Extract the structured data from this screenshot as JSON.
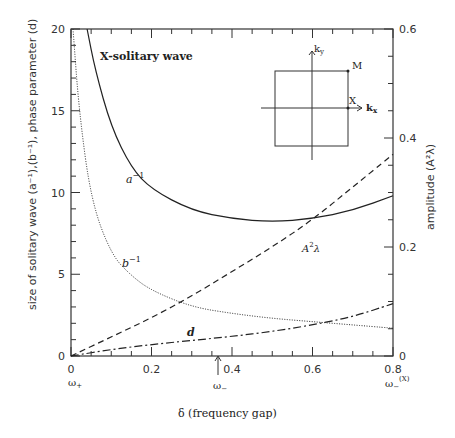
{
  "chart_data": {
    "type": "line",
    "title": "X-solitary wave",
    "xlabel": "δ (frequency gap)",
    "ylabel_left": "size of solitary wave (a⁻¹),(b⁻¹), phase parameter (d)",
    "ylabel_right": "amplitude (A²λ)",
    "xlim": [
      0,
      0.8
    ],
    "ylim_left": [
      0,
      20
    ],
    "ylim_right": [
      0,
      0.6
    ],
    "x_ticks": [
      "0",
      "0.2",
      "0.4",
      "0.6",
      "0.8"
    ],
    "y_left_ticks": [
      "0",
      "5",
      "10",
      "15",
      "20"
    ],
    "y_right_ticks": [
      "0",
      "0.2",
      "0.4",
      "0.6"
    ],
    "annotations": [
      "ω+",
      "ω−",
      "ω−(X)"
    ],
    "series": [
      {
        "name": "a⁻¹",
        "style": "solid",
        "axis": "left",
        "x": [
          0.04,
          0.06,
          0.1,
          0.15,
          0.2,
          0.3,
          0.4,
          0.5,
          0.6,
          0.7,
          0.8
        ],
        "values": [
          20,
          17.5,
          14,
          11.5,
          10.2,
          8.9,
          8.4,
          8.2,
          8.4,
          8.9,
          9.8
        ]
      },
      {
        "name": "b⁻¹",
        "style": "dotted",
        "axis": "left",
        "x": [
          0.005,
          0.02,
          0.05,
          0.1,
          0.15,
          0.2,
          0.3,
          0.4,
          0.5,
          0.6,
          0.7,
          0.8
        ],
        "values": [
          20,
          15,
          9.5,
          6.2,
          4.9,
          4.0,
          3.0,
          2.6,
          2.3,
          2.1,
          1.9,
          1.7
        ]
      },
      {
        "name": "A²λ",
        "style": "dashed",
        "axis": "right",
        "x": [
          0,
          0.1,
          0.2,
          0.3,
          0.4,
          0.5,
          0.6,
          0.7,
          0.8
        ],
        "values": [
          0,
          0.035,
          0.07,
          0.11,
          0.155,
          0.2,
          0.25,
          0.31,
          0.37
        ]
      },
      {
        "name": "d",
        "style": "dash-dot",
        "axis": "left",
        "x": [
          0,
          0.1,
          0.2,
          0.3,
          0.4,
          0.5,
          0.6,
          0.7,
          0.8
        ],
        "values": [
          0,
          0.4,
          0.7,
          0.95,
          1.2,
          1.5,
          1.9,
          2.4,
          3.2
        ]
      }
    ],
    "inset": {
      "labels": [
        "kx",
        "ky",
        "M",
        "X"
      ]
    }
  }
}
